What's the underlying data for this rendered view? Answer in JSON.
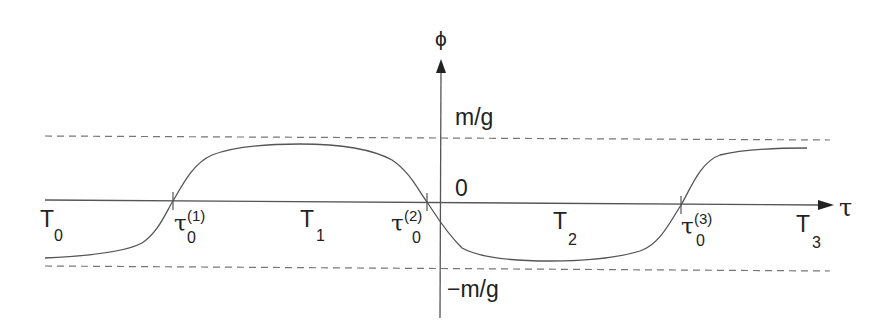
{
  "figure": {
    "axes": {
      "x_label": "τ",
      "y_label": "ϕ"
    },
    "levels": {
      "upper": "m/g",
      "zero": "0",
      "lower": "−m/g"
    },
    "regions": [
      {
        "base": "T",
        "sub": "0"
      },
      {
        "base": "T",
        "sub": "1"
      },
      {
        "base": "T",
        "sub": "2"
      },
      {
        "base": "T",
        "sub": "3"
      }
    ],
    "zero_crossings": [
      {
        "base": "τ",
        "sub": "0",
        "sup": "(1)"
      },
      {
        "base": "τ",
        "sub": "0",
        "sup": "(2)"
      },
      {
        "base": "τ",
        "sub": "0",
        "sup": "(3)"
      }
    ],
    "colors": {
      "line": "#555555",
      "text": "#222222"
    }
  }
}
